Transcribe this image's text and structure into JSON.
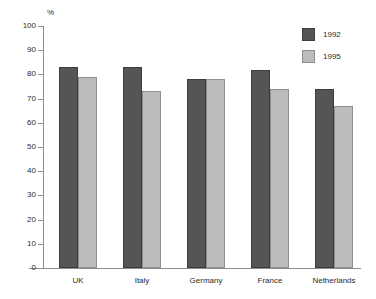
{
  "chart_data": {
    "type": "bar",
    "title": "",
    "xlabel": "",
    "ylabel": "%",
    "ylim": [
      0,
      100
    ],
    "ytick_step": 10,
    "yticks": [
      100,
      90,
      80,
      70,
      60,
      50,
      40,
      30,
      20,
      10,
      0
    ],
    "grid": false,
    "legend_position": "top-right",
    "categories": [
      "UK",
      "Italy",
      "Germany",
      "France",
      "Netherlands"
    ],
    "series": [
      {
        "name": "1992",
        "color": "#555555",
        "values": [
          83,
          83,
          78,
          82,
          74
        ]
      },
      {
        "name": "1995",
        "color": "#bcbcbc",
        "values": [
          79,
          73,
          78,
          74,
          67
        ]
      }
    ]
  },
  "axis": {
    "unit_label": "%"
  },
  "legend": {
    "entries": [
      {
        "label": "1992"
      },
      {
        "label": "1995"
      }
    ]
  }
}
